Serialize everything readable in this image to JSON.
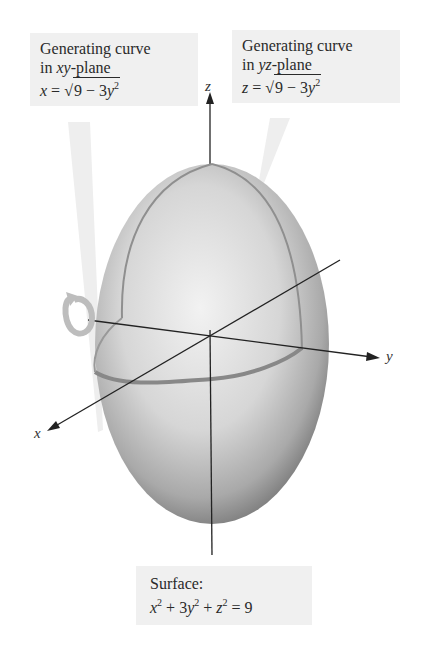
{
  "figure": {
    "callouts": {
      "xy_curve": {
        "line1": "Generating curve",
        "line2_prefix": "in ",
        "line2_var": "xy",
        "line2_suffix": "-plane",
        "eq_lhs": "x",
        "eq_eq": " = ",
        "eq_root_sign": "√",
        "eq_radicand": "9 − 3",
        "eq_var": "y",
        "eq_exp": "2"
      },
      "yz_curve": {
        "line1": "Generating curve",
        "line2_prefix": "in ",
        "line2_var": "yz",
        "line2_suffix": "-plane",
        "eq_lhs": "z",
        "eq_eq": " = ",
        "eq_root_sign": "√",
        "eq_radicand": "9 − 3",
        "eq_var": "y",
        "eq_exp": "2"
      },
      "surface": {
        "line1": "Surface:",
        "t1": "x",
        "e1": "2",
        "t2": " + 3",
        "t2v": "y",
        "e2": "2",
        "t3": " + ",
        "t3v": "z",
        "e3": "2",
        "t4": " = 9"
      }
    },
    "axes": {
      "x_label": "x",
      "y_label": "y",
      "z_label": "z"
    },
    "colors": {
      "callout_bg": "#f0f0f0",
      "surface_light": "#e8e8e8",
      "surface_dark": "#8a8a8a",
      "curve": "#8f8f8f",
      "axis": "#222222",
      "rotation_arrow": "#bdbdbd"
    }
  }
}
